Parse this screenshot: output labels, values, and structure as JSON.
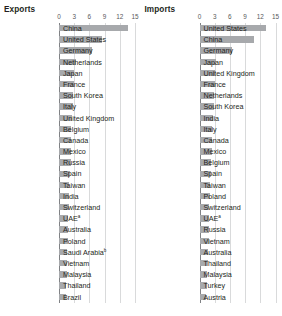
{
  "chart_data": [
    {
      "type": "bar",
      "title": "Exports",
      "orientation": "horizontal",
      "xlabel": "",
      "ylabel": "",
      "xlim": [
        0,
        15
      ],
      "xticks": [
        "0",
        "3",
        "6",
        "9",
        "12",
        "15"
      ],
      "grid": true,
      "legend": "none",
      "bar_color": "#a7a9ac",
      "categories": [
        "China",
        "United States",
        "Germany",
        "Netherlands",
        "Japan",
        "France",
        "South Korea",
        "Italy",
        "United Kingdom",
        "Belgium",
        "Canada",
        "Mexico",
        "Russia",
        "Spain",
        "Taiwan",
        "India",
        "Switzerland",
        "UAE",
        "Australia",
        "Poland",
        "Saudi Arabia",
        "Vietnam",
        "Malaysia",
        "Thailand",
        "Brazil"
      ],
      "category_footnotes": {
        "UAE": "a",
        "Saudi Arabia": "b"
      },
      "values": [
        13.6,
        8.5,
        6.6,
        3.4,
        3.0,
        2.9,
        2.8,
        2.7,
        2.5,
        2.4,
        2.4,
        2.3,
        2.3,
        2.1,
        2.0,
        1.9,
        1.9,
        1.8,
        1.7,
        1.7,
        1.6,
        1.6,
        1.5,
        1.4,
        1.3
      ]
    },
    {
      "type": "bar",
      "title": "Imports",
      "orientation": "horizontal",
      "xlabel": "",
      "ylabel": "",
      "xlim": [
        0,
        15
      ],
      "xticks": [
        "0",
        "3",
        "6",
        "9",
        "12",
        "15"
      ],
      "grid": true,
      "legend": "none",
      "bar_color": "#a7a9ac",
      "categories": [
        "United States",
        "China",
        "Germany",
        "Japan",
        "United Kingdom",
        "France",
        "Netherlands",
        "South Korea",
        "India",
        "Italy",
        "Canada",
        "Mexico",
        "Belgium",
        "Spain",
        "Taiwan",
        "Poland",
        "Switzerland",
        "UAE",
        "Russia",
        "Vietnam",
        "Australia",
        "Thailand",
        "Malaysia",
        "Turkey",
        "Austria"
      ],
      "category_footnotes": {
        "UAE": "a"
      },
      "values": [
        13.2,
        10.8,
        6.5,
        3.3,
        3.1,
        3.0,
        2.9,
        2.8,
        2.7,
        2.5,
        2.4,
        2.4,
        2.3,
        2.2,
        2.0,
        2.0,
        1.9,
        1.9,
        1.8,
        1.8,
        1.7,
        1.6,
        1.5,
        1.4,
        1.3
      ]
    }
  ],
  "panels": [
    {
      "title": "Exports"
    },
    {
      "title": "Imports"
    }
  ]
}
